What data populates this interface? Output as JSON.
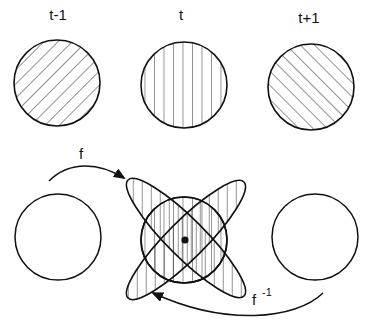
{
  "diagram": {
    "type": "dynamical-system-illustration",
    "colors": {
      "stroke": "#111111",
      "background": "#ffffff"
    },
    "top_row": {
      "labels": [
        "t-1",
        "t",
        "t+1"
      ],
      "circles": [
        {
          "name": "state-t-minus-1",
          "hatch": "diagonal-backslash"
        },
        {
          "name": "state-t",
          "hatch": "vertical"
        },
        {
          "name": "state-t-plus-1",
          "hatch": "diagonal-slash"
        }
      ]
    },
    "bottom_row": {
      "left_circle": {
        "hatch": "none"
      },
      "center": {
        "circle_hatch": "vertical",
        "lobes": "two crossed hatched ellipses",
        "center_point": "fixed point"
      },
      "right_circle": {
        "hatch": "none"
      }
    },
    "arrows": {
      "forward": {
        "label": "f"
      },
      "inverse": {
        "label": "f",
        "superscript": "-1"
      }
    }
  }
}
